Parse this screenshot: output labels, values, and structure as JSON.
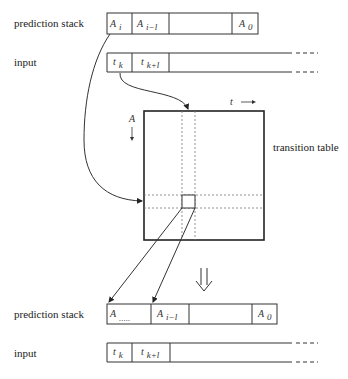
{
  "labels": {
    "prediction_stack_top": "prediction stack",
    "input_top": "input",
    "transition_table": "transition table",
    "prediction_stack_bottom": "prediction stack",
    "input_bottom": "input",
    "t_axis": "t",
    "a_axis": "A"
  },
  "top_stack": {
    "cells": [
      {
        "sym": "A",
        "sub": "i"
      },
      {
        "sym": "A",
        "sub": "i−l"
      },
      {
        "sym": "",
        "sub": ""
      },
      {
        "sym": "A",
        "sub": "0"
      }
    ]
  },
  "top_input": {
    "cells": [
      {
        "sym": "t",
        "sub": "k"
      },
      {
        "sym": "t",
        "sub": "k+l"
      }
    ]
  },
  "bottom_stack": {
    "cells": [
      {
        "sym": "A",
        "sub": "....."
      },
      {
        "sym": "A",
        "sub": "i−l"
      },
      {
        "sym": "",
        "sub": ""
      },
      {
        "sym": "A",
        "sub": "0"
      }
    ]
  },
  "bottom_input": {
    "cells": [
      {
        "sym": "t",
        "sub": "k"
      },
      {
        "sym": "t",
        "sub": "k+l"
      }
    ]
  },
  "colors": {
    "line": "#333333",
    "dotted": "#777777"
  }
}
